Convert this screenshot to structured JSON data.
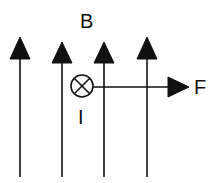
{
  "diagram": {
    "field": {
      "label": "B",
      "direction": "up",
      "line_count": 4
    },
    "current": {
      "label": "I",
      "symbol": "cross-in-circle",
      "direction": "into-page"
    },
    "force": {
      "label": "F",
      "direction": "right"
    },
    "colors": {
      "ink": "#111111",
      "background": "#ffffff"
    }
  }
}
